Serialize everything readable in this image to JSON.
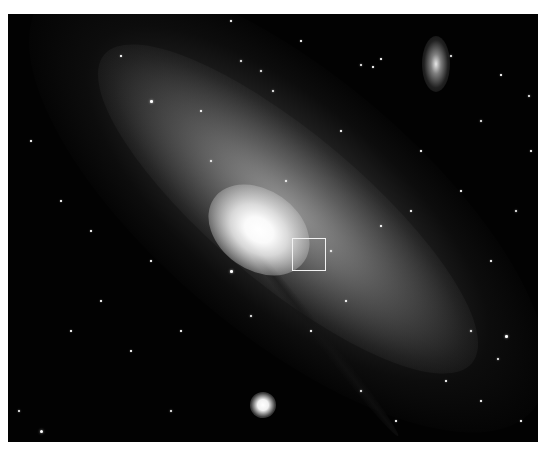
{
  "image": {
    "subject": "spiral galaxy with satellite galaxies in star field",
    "background_color": "#020202",
    "frame": {
      "x": 8,
      "y": 14,
      "width": 530,
      "height": 428
    }
  },
  "overlay": {
    "selection_box": {
      "x": 292,
      "y": 238,
      "width": 34,
      "height": 33,
      "color": "#f2f2f2"
    }
  },
  "stars": [
    [
      150,
      100,
      2.5
    ],
    [
      240,
      60,
      2
    ],
    [
      260,
      70,
      2
    ],
    [
      272,
      90,
      2
    ],
    [
      300,
      40,
      1.5
    ],
    [
      360,
      64,
      2
    ],
    [
      372,
      66,
      1.5
    ],
    [
      380,
      58,
      1.5
    ],
    [
      450,
      55,
      2
    ],
    [
      500,
      74,
      1.5
    ],
    [
      528,
      95,
      2
    ],
    [
      530,
      150,
      1.5
    ],
    [
      515,
      210,
      2
    ],
    [
      490,
      260,
      1.5
    ],
    [
      470,
      330,
      2
    ],
    [
      505,
      335,
      2.5
    ],
    [
      497,
      358,
      2
    ],
    [
      520,
      420,
      1.5
    ],
    [
      40,
      430,
      3
    ],
    [
      60,
      470,
      1.5
    ],
    [
      100,
      300,
      1.5
    ],
    [
      130,
      350,
      1.5
    ],
    [
      180,
      330,
      1.5
    ],
    [
      90,
      230,
      1.5
    ],
    [
      30,
      140,
      1.5
    ],
    [
      60,
      200,
      1.5
    ],
    [
      210,
      160,
      2
    ],
    [
      285,
      180,
      2
    ],
    [
      330,
      250,
      2
    ],
    [
      345,
      300,
      1.5
    ],
    [
      380,
      225,
      1.5
    ],
    [
      410,
      210,
      1.5
    ],
    [
      360,
      390,
      2
    ],
    [
      395,
      420,
      1.5
    ],
    [
      170,
      410,
      2
    ],
    [
      230,
      270,
      2.5
    ],
    [
      310,
      330,
      1.5
    ],
    [
      420,
      150,
      1.5
    ],
    [
      460,
      190,
      1.5
    ],
    [
      480,
      120,
      2
    ],
    [
      120,
      55,
      1.5
    ],
    [
      200,
      110,
      1.5
    ],
    [
      18,
      410,
      2
    ],
    [
      340,
      130,
      1.5
    ],
    [
      250,
      315,
      2
    ],
    [
      230,
      20,
      1.5
    ],
    [
      480,
      400,
      1.5
    ],
    [
      445,
      380,
      1.5
    ],
    [
      150,
      260,
      1.5
    ],
    [
      70,
      330,
      1.5
    ]
  ]
}
